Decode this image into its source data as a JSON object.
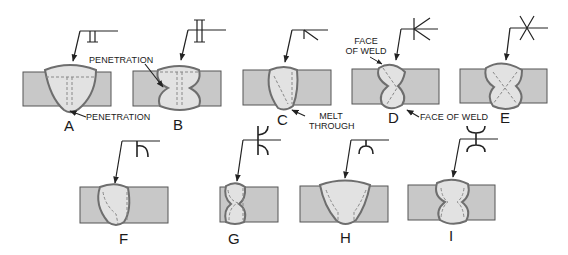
{
  "colors": {
    "plate": "#c8c8c8",
    "plate_stroke": "#555555",
    "weld_fill": "#e2e2e2",
    "weld_stroke": "#6e6e6e",
    "line": "#222222",
    "text": "#1a1a1a"
  },
  "figures": [
    {
      "id": "A",
      "letter": "A",
      "symbol": "square-groove",
      "weld": "single-side penetration"
    },
    {
      "id": "B",
      "letter": "B",
      "symbol": "square-groove-both-sides",
      "weld": "double-sided"
    },
    {
      "id": "C",
      "letter": "C",
      "symbol": "bevel-groove",
      "weld": "melt through"
    },
    {
      "id": "D",
      "letter": "D",
      "symbol": "double-bevel-groove",
      "weld": "double-sided"
    },
    {
      "id": "E",
      "letter": "E",
      "symbol": "double-v-groove",
      "weld": "double-sided"
    },
    {
      "id": "F",
      "letter": "F",
      "symbol": "j-groove",
      "weld": "single-side"
    },
    {
      "id": "G",
      "letter": "G",
      "symbol": "double-j-groove",
      "weld": "double-sided"
    },
    {
      "id": "H",
      "letter": "H",
      "symbol": "u-groove",
      "weld": "single-side"
    },
    {
      "id": "I",
      "letter": "I",
      "symbol": "double-u-groove",
      "weld": "double-sided"
    }
  ],
  "annotations": {
    "a_penetration": "PENETRATION",
    "b_penetration": "PENETRATION",
    "c_melt_line1": "MELT",
    "c_melt_line2": "THROUGH",
    "d_face_line1": "FACE",
    "d_face_line2": "OF WELD",
    "d_face_bottom": "FACE OF WELD"
  }
}
